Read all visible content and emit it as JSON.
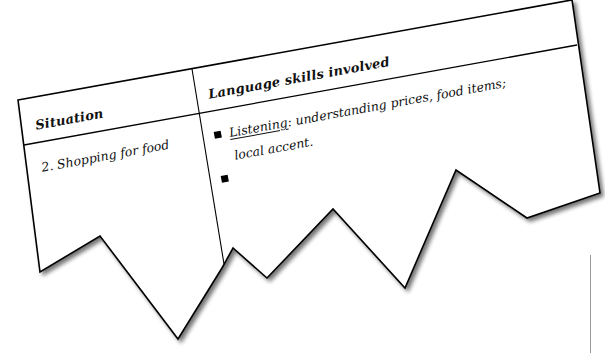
{
  "table": {
    "headers": {
      "situation": "Situation",
      "language_skills": "Language skills involved"
    },
    "rows": [
      {
        "situation": "2. Shopping for food",
        "skills": [
          {
            "label": "Listening",
            "separator": ":",
            "text": " understanding prices, food items;",
            "continuation": "local accent."
          },
          {
            "label": "",
            "separator": "",
            "text": "",
            "continuation": ""
          }
        ]
      }
    ]
  },
  "style": {
    "line_color": "#000000",
    "background": "#ffffff",
    "shadow_color": "#555555",
    "bullet_icon": "black-square"
  }
}
